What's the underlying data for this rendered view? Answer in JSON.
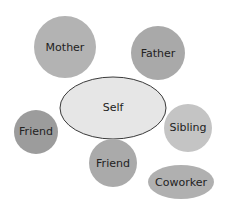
{
  "diagram": {
    "type": "relationship-map",
    "center": {
      "label": "Self",
      "fill": "#e6e6e6",
      "stroke": "#3a3a3a"
    },
    "nodes": [
      {
        "id": "mother",
        "label": "Mother",
        "fill": "#b3b3b3"
      },
      {
        "id": "father",
        "label": "Father",
        "fill": "#a9a9a9"
      },
      {
        "id": "friend-left",
        "label": "Friend",
        "fill": "#9c9c9c"
      },
      {
        "id": "sibling",
        "label": "Sibling",
        "fill": "#c4c4c4"
      },
      {
        "id": "friend-bottom",
        "label": "Friend",
        "fill": "#aaaaaa"
      },
      {
        "id": "coworker",
        "label": "Coworker",
        "fill": "#b0b0b0"
      }
    ]
  }
}
